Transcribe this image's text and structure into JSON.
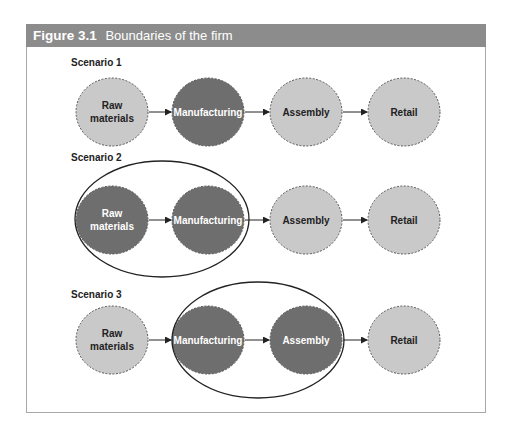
{
  "figure": {
    "number": "Figure 3.1",
    "title": "Boundaries of the firm"
  },
  "colors": {
    "header_bg": "#8c8c8c",
    "node_inside_fill": "#6e6e6e",
    "node_outside_fill": "#c9c9c9",
    "node_border": "#555555",
    "boundary_line": "#222222"
  },
  "scenarios": [
    {
      "label": "Scenario 1",
      "nodes": [
        {
          "label_lines": [
            "Raw",
            "materials"
          ],
          "inside_firm": false
        },
        {
          "label_lines": [
            "Manufacturing"
          ],
          "inside_firm": true
        },
        {
          "label_lines": [
            "Assembly"
          ],
          "inside_firm": false
        },
        {
          "label_lines": [
            "Retail"
          ],
          "inside_firm": false
        }
      ],
      "boundary": null
    },
    {
      "label": "Scenario 2",
      "nodes": [
        {
          "label_lines": [
            "Raw",
            "materials"
          ],
          "inside_firm": true
        },
        {
          "label_lines": [
            "Manufacturing"
          ],
          "inside_firm": true
        },
        {
          "label_lines": [
            "Assembly"
          ],
          "inside_firm": false
        },
        {
          "label_lines": [
            "Retail"
          ],
          "inside_firm": false
        }
      ],
      "boundary": "Raw materials + Manufacturing"
    },
    {
      "label": "Scenario 3",
      "nodes": [
        {
          "label_lines": [
            "Raw",
            "materials"
          ],
          "inside_firm": false
        },
        {
          "label_lines": [
            "Manufacturing"
          ],
          "inside_firm": true
        },
        {
          "label_lines": [
            "Assembly"
          ],
          "inside_firm": true
        },
        {
          "label_lines": [
            "Retail"
          ],
          "inside_firm": false
        }
      ],
      "boundary": "Manufacturing + Assembly"
    }
  ]
}
